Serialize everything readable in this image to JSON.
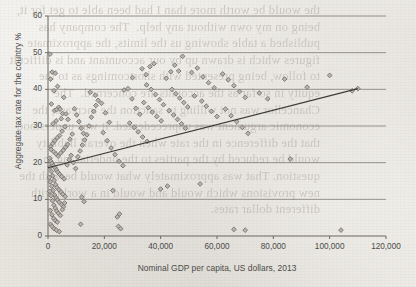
{
  "page": {
    "bleed_text": "the would be worth more than I had been able to get for it, being on my own without any help.  The company has published a table showing us the limits, the approximate figures which is drawn up by our accountant and is difficult to follow, being presented with shortcomings as to the equity in so far as the accounts are concerned.  The Chancellor was not willing to sanction the increase, the economic argument was unprecedented. It was understood that the difference in the rate when the overall liability would be reduced by the parties to the undertaking in question. That was approximately what would be with the new provisions which would and would in a world with different dollar rates."
  },
  "chart_data": {
    "type": "scatter",
    "title": "",
    "xlabel": "Nominal GDP per capita, US dollars, 2013",
    "ylabel": "Aggregate tax rate for the country %",
    "xlim": [
      0,
      120000
    ],
    "ylim": [
      0,
      60
    ],
    "xticks": [
      0,
      20000,
      40000,
      60000,
      80000,
      100000,
      120000
    ],
    "xtick_labels": [
      "0",
      "20,000",
      "40,000",
      "60,000",
      "80,000",
      "100,000",
      "120,000"
    ],
    "yticks": [
      0,
      10,
      20,
      30,
      40,
      50,
      60
    ],
    "ytick_labels": [
      "0",
      "10",
      "20",
      "30",
      "40",
      "50",
      "60"
    ],
    "grid": "horizontal",
    "legend": "none",
    "marker": "diamond",
    "marker_fill": "#b9b5ae",
    "marker_edge": "#6f6b64",
    "trendline": {
      "type": "linear",
      "x": [
        0,
        110000
      ],
      "y": [
        18.6,
        40.2
      ],
      "color": "#3d3a35"
    },
    "points": [
      [
        700,
        49.6
      ],
      [
        900,
        42.8
      ],
      [
        1500,
        44.7
      ],
      [
        2600,
        44.4
      ],
      [
        3400,
        40.8
      ],
      [
        2100,
        39.6
      ],
      [
        5600,
        37.8
      ],
      [
        1200,
        36.0
      ],
      [
        2300,
        34.2
      ],
      [
        3100,
        34.5
      ],
      [
        3800,
        35.1
      ],
      [
        4300,
        34.6
      ],
      [
        5200,
        33.4
      ],
      [
        4700,
        32.0
      ],
      [
        2900,
        31.4
      ],
      [
        1800,
        30.6
      ],
      [
        6400,
        33.3
      ],
      [
        7100,
        31.8
      ],
      [
        6000,
        29.8
      ],
      [
        5000,
        28.6
      ],
      [
        4100,
        27.4
      ],
      [
        3300,
        26.8
      ],
      [
        2400,
        26.0
      ],
      [
        1600,
        25.2
      ],
      [
        900,
        24.4
      ],
      [
        1100,
        23.6
      ],
      [
        2000,
        23.0
      ],
      [
        2800,
        22.4
      ],
      [
        3600,
        21.8
      ],
      [
        4500,
        22.6
      ],
      [
        5400,
        23.4
      ],
      [
        6200,
        24.2
      ],
      [
        7000,
        25.0
      ],
      [
        7800,
        26.4
      ],
      [
        8600,
        27.8
      ],
      [
        600,
        21.2
      ],
      [
        1000,
        20.4
      ],
      [
        1400,
        19.8
      ],
      [
        1900,
        19.2
      ],
      [
        2500,
        18.6
      ],
      [
        3000,
        18.0
      ],
      [
        3500,
        17.4
      ],
      [
        4200,
        16.8
      ],
      [
        4900,
        16.2
      ],
      [
        5700,
        15.6
      ],
      [
        700,
        18.8
      ],
      [
        1200,
        17.6
      ],
      [
        1700,
        16.4
      ],
      [
        2200,
        15.2
      ],
      [
        2700,
        14.0
      ],
      [
        3200,
        13.2
      ],
      [
        3900,
        12.6
      ],
      [
        4600,
        12.0
      ],
      [
        5300,
        11.4
      ],
      [
        6100,
        10.8
      ],
      [
        500,
        16.0
      ],
      [
        800,
        14.8
      ],
      [
        1300,
        13.6
      ],
      [
        1800,
        12.4
      ],
      [
        2300,
        11.2
      ],
      [
        2900,
        10.4
      ],
      [
        3400,
        9.8
      ],
      [
        4000,
        9.2
      ],
      [
        4800,
        8.6
      ],
      [
        5500,
        8.0
      ],
      [
        600,
        12.2
      ],
      [
        1100,
        11.0
      ],
      [
        1600,
        9.6
      ],
      [
        2100,
        8.4
      ],
      [
        2600,
        7.6
      ],
      [
        3100,
        6.8
      ],
      [
        3700,
        6.2
      ],
      [
        4400,
        5.6
      ],
      [
        5100,
        7.2
      ],
      [
        5900,
        9.0
      ],
      [
        800,
        7.0
      ],
      [
        1400,
        5.8
      ],
      [
        2000,
        4.8
      ],
      [
        2600,
        4.2
      ],
      [
        3300,
        3.8
      ],
      [
        900,
        3.2
      ],
      [
        1500,
        2.6
      ],
      [
        2200,
        2.0
      ],
      [
        3000,
        1.6
      ],
      [
        4000,
        1.2
      ],
      [
        6800,
        19.4
      ],
      [
        7500,
        20.8
      ],
      [
        8200,
        22.0
      ],
      [
        9000,
        20.0
      ],
      [
        9800,
        18.4
      ],
      [
        10600,
        21.6
      ],
      [
        11400,
        23.2
      ],
      [
        12200,
        24.8
      ],
      [
        13000,
        26.2
      ],
      [
        13800,
        27.6
      ],
      [
        9400,
        34.7
      ],
      [
        10200,
        33.0
      ],
      [
        11000,
        31.2
      ],
      [
        11800,
        29.4
      ],
      [
        12600,
        28.0
      ],
      [
        14600,
        30.0
      ],
      [
        15400,
        32.4
      ],
      [
        16200,
        34.0
      ],
      [
        17000,
        35.6
      ],
      [
        17800,
        37.0
      ],
      [
        15000,
        39.2
      ],
      [
        16800,
        38.4
      ],
      [
        19000,
        36.2
      ],
      [
        20400,
        33.6
      ],
      [
        21800,
        31.0
      ],
      [
        19600,
        28.2
      ],
      [
        21000,
        26.0
      ],
      [
        22400,
        24.0
      ],
      [
        23800,
        22.2
      ],
      [
        25200,
        20.4
      ],
      [
        12000,
        10.6
      ],
      [
        12800,
        9.4
      ],
      [
        11600,
        3.2
      ],
      [
        23000,
        12.4
      ],
      [
        24600,
        5.2
      ],
      [
        25400,
        6.0
      ],
      [
        25000,
        2.6
      ],
      [
        25800,
        2.0
      ],
      [
        26600,
        19.2
      ],
      [
        27000,
        39.8
      ],
      [
        28400,
        40.2
      ],
      [
        29800,
        37.4
      ],
      [
        31200,
        34.8
      ],
      [
        32600,
        33.2
      ],
      [
        30000,
        43.2
      ],
      [
        33400,
        45.6
      ],
      [
        34800,
        44.0
      ],
      [
        36200,
        46.2
      ],
      [
        37600,
        47.0
      ],
      [
        35000,
        41.2
      ],
      [
        36600,
        40.0
      ],
      [
        38200,
        38.6
      ],
      [
        39600,
        37.2
      ],
      [
        41000,
        35.8
      ],
      [
        34000,
        36.4
      ],
      [
        35600,
        35.0
      ],
      [
        37000,
        33.8
      ],
      [
        38600,
        32.6
      ],
      [
        40200,
        31.4
      ],
      [
        29000,
        30.8
      ],
      [
        30600,
        29.6
      ],
      [
        32000,
        28.4
      ],
      [
        33600,
        27.0
      ],
      [
        35200,
        25.8
      ],
      [
        42000,
        43.0
      ],
      [
        43600,
        44.8
      ],
      [
        45000,
        46.6
      ],
      [
        46400,
        45.0
      ],
      [
        47800,
        49.0
      ],
      [
        44000,
        40.0
      ],
      [
        45400,
        38.8
      ],
      [
        46800,
        37.6
      ],
      [
        48200,
        36.4
      ],
      [
        49600,
        35.2
      ],
      [
        43000,
        34.2
      ],
      [
        44600,
        33.0
      ],
      [
        46000,
        31.8
      ],
      [
        47400,
        30.6
      ],
      [
        48800,
        29.4
      ],
      [
        40000,
        12.8
      ],
      [
        42400,
        13.6
      ],
      [
        54000,
        14.2
      ],
      [
        51000,
        44.6
      ],
      [
        53000,
        45.8
      ],
      [
        55000,
        43.4
      ],
      [
        57000,
        41.8
      ],
      [
        59000,
        40.4
      ],
      [
        52000,
        38.2
      ],
      [
        54600,
        36.8
      ],
      [
        56200,
        35.4
      ],
      [
        58000,
        34.0
      ],
      [
        60000,
        32.6
      ],
      [
        62000,
        44.2
      ],
      [
        64000,
        42.6
      ],
      [
        66000,
        41.0
      ],
      [
        68000,
        39.4
      ],
      [
        70000,
        37.8
      ],
      [
        63000,
        34.6
      ],
      [
        65000,
        32.8
      ],
      [
        67000,
        31.2
      ],
      [
        69000,
        29.6
      ],
      [
        71000,
        28.0
      ],
      [
        66000,
        1.8
      ],
      [
        70000,
        1.6
      ],
      [
        75000,
        39.0
      ],
      [
        78000,
        37.4
      ],
      [
        84000,
        42.8
      ],
      [
        86000,
        21.0
      ],
      [
        92000,
        40.6
      ],
      [
        100000,
        43.8
      ],
      [
        104000,
        1.6
      ],
      [
        108000,
        39.6
      ],
      [
        110000,
        40.2
      ]
    ]
  }
}
